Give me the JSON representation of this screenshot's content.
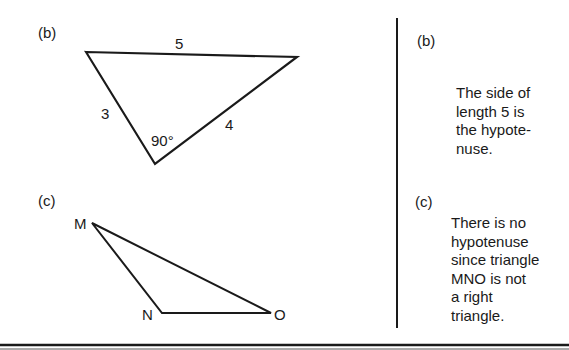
{
  "left": {
    "part_b": {
      "label": "(b)",
      "side_top": "5",
      "side_left": "3",
      "side_right": "4",
      "angle": "90°"
    },
    "part_c": {
      "label": "(c)",
      "vertex_m": "M",
      "vertex_n": "N",
      "vertex_o": "O"
    }
  },
  "right": {
    "part_b": {
      "label": "(b)",
      "text": "The side of\nlength 5 is\nthe hypote-\nnuse."
    },
    "part_c": {
      "label": "(c)",
      "text": "There is no\nhypotenuse\nsince triangle\nMNO is not\na right\ntriangle."
    }
  },
  "colors": {
    "ink": "#1a1a1a",
    "background": "#ffffff"
  }
}
